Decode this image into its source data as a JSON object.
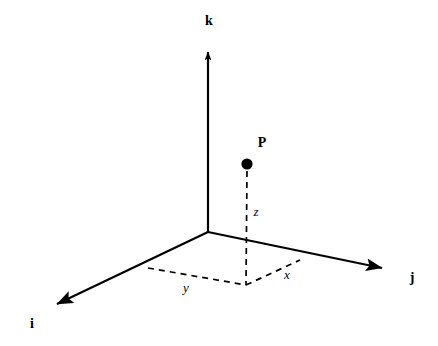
{
  "figure": {
    "kind": "3d-cartesian-coordinate-diagram",
    "background_color": "#ffffff",
    "stroke_color": "#000000",
    "width": 438,
    "height": 346
  },
  "origin": {
    "x": 208,
    "y": 232
  },
  "axes": [
    {
      "id": "k",
      "label": "k",
      "label_style": "bold",
      "label_x": 209,
      "label_y": 21,
      "from_x": 208,
      "from_y": 232,
      "to_x": 208,
      "to_y": 36,
      "arrow": true,
      "line_style": "solid"
    },
    {
      "id": "i",
      "label": "i",
      "label_style": "bold",
      "label_x": 32,
      "label_y": 324,
      "from_x": 208,
      "from_y": 232,
      "to_x": 45,
      "to_y": 310,
      "arrow": true,
      "line_style": "solid"
    },
    {
      "id": "j",
      "label": "j",
      "label_style": "bold",
      "label_x": 412,
      "label_y": 278,
      "from_x": 208,
      "from_y": 232,
      "to_x": 394,
      "to_y": 271,
      "arrow": true,
      "line_style": "solid"
    }
  ],
  "point": {
    "label": "P",
    "label_x": 262,
    "label_y": 143,
    "x": 247,
    "y": 164,
    "radius": 5.5,
    "fill": "#000000"
  },
  "projection": {
    "foot_x": 246,
    "foot_y": 285,
    "i_axis_anchor_x": 148,
    "i_axis_anchor_y": 268,
    "j_axis_anchor_x": 300,
    "j_axis_anchor_y": 260
  },
  "components": [
    {
      "id": "z",
      "label": "z",
      "label_style": "italic",
      "label_x": 256,
      "label_y": 211,
      "from_x": 247,
      "from_y": 170,
      "to_x": 246,
      "to_y": 285,
      "line_style": "dashed",
      "meaning": "vertical drop from P to the ij-plane"
    },
    {
      "id": "y",
      "label": "y",
      "label_style": "italic",
      "label_x": 186,
      "label_y": 287,
      "from_x": 148,
      "from_y": 268,
      "to_x": 246,
      "to_y": 285,
      "line_style": "dashed",
      "meaning": "projection segment parallel to the j direction"
    },
    {
      "id": "x",
      "label": "x",
      "label_style": "italic",
      "label_x": 287,
      "label_y": 274,
      "from_x": 246,
      "from_y": 285,
      "to_x": 300,
      "to_y": 260,
      "line_style": "dashed",
      "meaning": "projection segment parallel to the i direction"
    }
  ],
  "dash_pattern": "6,5",
  "stroke_width_axis": 2,
  "stroke_width_dash": 1.6
}
